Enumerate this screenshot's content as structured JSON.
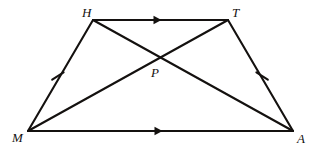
{
  "figure": {
    "type": "geometry-diagram",
    "shape_name": "isosceles-trapezoid",
    "stroke_color": "#14110f",
    "background_color": "#ffffff",
    "stroke_width": 2.1,
    "vertices": [
      {
        "id": "H",
        "label": "H",
        "x": 93,
        "y": 20,
        "label_x": 82,
        "label_y": 6
      },
      {
        "id": "T",
        "label": "T",
        "x": 228,
        "y": 20,
        "label_x": 232,
        "label_y": 6
      },
      {
        "id": "M",
        "label": "M",
        "x": 28,
        "y": 131,
        "label_x": 12,
        "label_y": 131
      },
      {
        "id": "A",
        "label": "A",
        "x": 293,
        "y": 131,
        "label_x": 297,
        "label_y": 132
      }
    ],
    "interior_points": [
      {
        "id": "P",
        "label": "P",
        "x": 158,
        "y": 58,
        "label_x": 151,
        "label_y": 66
      }
    ],
    "sides": [
      {
        "id": "HT",
        "from": "H",
        "to": "T",
        "marks": "single-arrow",
        "parallel_group": 1
      },
      {
        "id": "MA",
        "from": "M",
        "to": "A",
        "marks": "single-arrow",
        "parallel_group": 1
      },
      {
        "id": "MH",
        "from": "M",
        "to": "H",
        "marks": "single-tick",
        "congruent_group": 1
      },
      {
        "id": "TA",
        "from": "T",
        "to": "A",
        "marks": "single-tick",
        "congruent_group": 1
      }
    ],
    "diagonals": [
      {
        "id": "MT",
        "from": "M",
        "to": "T",
        "marks": "none"
      },
      {
        "id": "HA",
        "from": "H",
        "to": "A",
        "marks": "none"
      }
    ],
    "arrow_markers": [
      {
        "on": "HT",
        "x": 159,
        "y": 20,
        "direction": "right"
      },
      {
        "on": "MA",
        "x": 160,
        "y": 131,
        "direction": "right"
      }
    ],
    "tick_markers": [
      {
        "on": "MH",
        "x": 58,
        "y": 76
      },
      {
        "on": "TA",
        "x": 262,
        "y": 76
      }
    ]
  }
}
